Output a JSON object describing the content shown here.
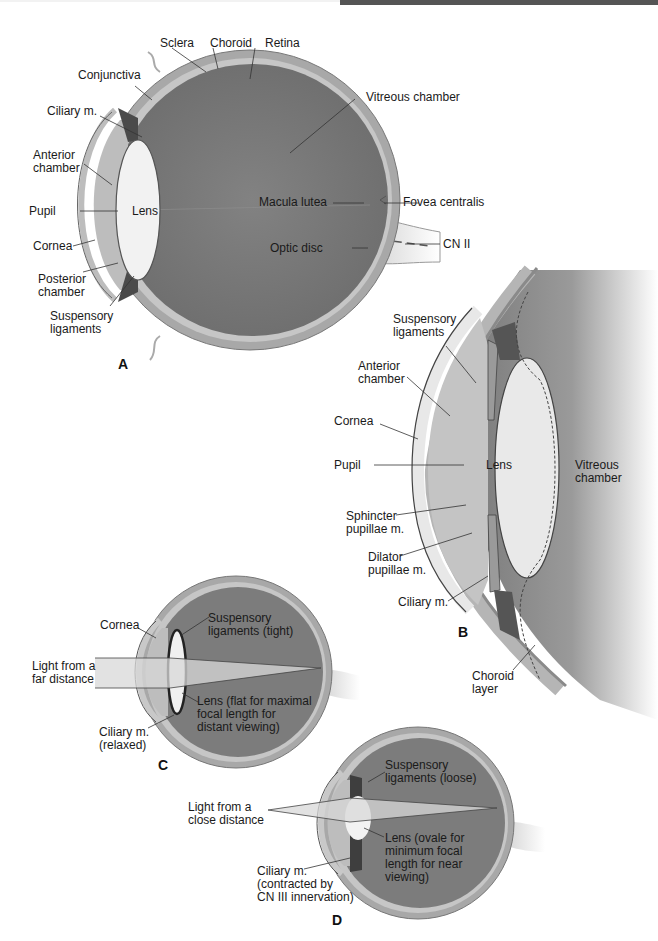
{
  "figure": {
    "colors": {
      "vitreous": "#7a7a7a",
      "sclera": "#a9a9a9",
      "choroid": "#c8c8c8",
      "lens": "#eeeeee",
      "cornea": "#d9d9d9",
      "leader_line": "#333333"
    },
    "panels": [
      {
        "id": "A",
        "letter": "A",
        "labels": {
          "sclera": "Sclera",
          "choroid": "Choroid",
          "retina": "Retina",
          "conjunctiva": "Conjunctiva",
          "ciliary_m": "Ciliary m.",
          "vitreous_chamber": "Vitreous chamber",
          "anterior_chamber": "Anterior\nchamber",
          "pupil": "Pupil",
          "lens": "Lens",
          "cornea": "Cornea",
          "macula_lutea": "Macula lutea",
          "fovea_centralis": "Fovea centralis",
          "optic_disc": "Optic disc",
          "cn_ii": "CN II",
          "posterior_chamber": "Posterior\nchamber",
          "suspensory_ligaments": "Suspensory\nligaments"
        }
      },
      {
        "id": "B",
        "letter": "B",
        "labels": {
          "suspensory_ligaments": "Suspensory\nligaments",
          "anterior_chamber": "Anterior\nchamber",
          "cornea": "Cornea",
          "pupil": "Pupil",
          "lens": "Lens",
          "vitreous_chamber": "Vitreous\nchamber",
          "sphincter_pupillae": "Sphincter\npupillae m.",
          "dilator_pupillae": "Dilator\npupillae m.",
          "ciliary_m": "Ciliary m.",
          "choroid_layer": "Choroid\nlayer"
        }
      },
      {
        "id": "C",
        "letter": "C",
        "labels": {
          "cornea": "Cornea",
          "suspensory_ligaments": "Suspensory\nligaments (tight)",
          "light": "Light from a\nfar distance",
          "lens": "Lens (flat for maximal\nfocal length for\ndistant viewing)",
          "ciliary_m": "Ciliary m.\n(relaxed)"
        }
      },
      {
        "id": "D",
        "letter": "D",
        "labels": {
          "suspensory_ligaments": "Suspensory\nligaments (loose)",
          "light": "Light from a\nclose distance",
          "lens": "Lens (ovale for\nminimum focal\nlength for near\nviewing)",
          "ciliary_m": "Ciliary m.\n(contracted by\nCN III innervation)"
        }
      }
    ]
  }
}
